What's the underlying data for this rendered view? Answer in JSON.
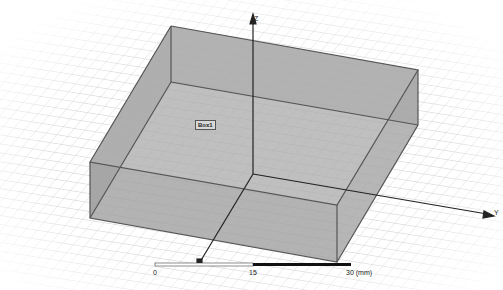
{
  "viewport": {
    "background": "#ffffff",
    "grid_color": "#d6d6d6",
    "box_fill": "#a9a9a9",
    "box_edge": "#555555"
  },
  "object": {
    "label": "Box1"
  },
  "axes": {
    "z_label": "Z",
    "y_label": "Y",
    "x_label": "X"
  },
  "ruler": {
    "ticks": [
      "0",
      "15",
      "30 (mm)"
    ]
  }
}
